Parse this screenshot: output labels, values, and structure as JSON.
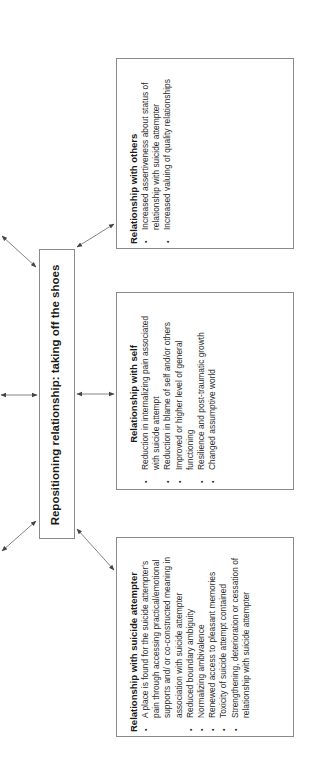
{
  "diagram": {
    "orientation": "rotated -90deg (page landscape)",
    "center": {
      "label": "Repositioning relationship: taking off the shoes"
    },
    "panels": [
      {
        "id": "others",
        "title": "Relationship with others",
        "items": [
          "Increased assertiveness about status of relationship with suicide attempter",
          "Increased valuing of quality relationships"
        ]
      },
      {
        "id": "self",
        "title": "Relationship with self",
        "items": [
          "Reduction in internalizing pain associated with suicide attempt",
          "Reduction in blame of self and/or others",
          "Improved or higher level of general functioning",
          "Resilience and post-traumatic growth",
          "Changed assumptive world"
        ]
      },
      {
        "id": "attempter",
        "title": "Relationship with suicide attempter",
        "items": [
          "A place is found for the suicide attempter's pain through accessing practical/emotional supports and/ or co-constructed meaning in association with suicide attempter",
          "Reduced boundary ambiguity",
          "Normalizing ambivalence",
          "Renewed access to pleasant memories",
          "Toxicity of suicide attempt contained",
          "Strengthening, deterioration or cessation of relationship with suicide attempter"
        ]
      }
    ],
    "connectors": [
      {
        "from": "center",
        "to": "others",
        "type": "double-arrow"
      },
      {
        "from": "center",
        "to": "self",
        "type": "double-arrow"
      },
      {
        "from": "center",
        "to": "attempter",
        "type": "double-arrow"
      },
      {
        "from": "center",
        "to": "offscreen-top-left",
        "type": "double-arrow"
      },
      {
        "from": "center",
        "to": "offscreen-left",
        "type": "double-arrow"
      },
      {
        "from": "center",
        "to": "offscreen-bottom-left",
        "type": "double-arrow"
      }
    ],
    "colors": {
      "border": "#8a8a8a",
      "arrow": "#555555",
      "text": "#1a1a1a"
    }
  }
}
